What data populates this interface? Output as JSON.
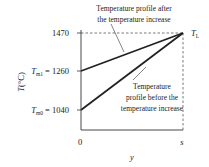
{
  "diagram": {
    "y_axis": {
      "label_main": "T",
      "label_unit": "(°C)",
      "ticks": [
        {
          "value": "1470",
          "prefix": "",
          "sub": ""
        },
        {
          "value": "1260",
          "prefix": "T",
          "sub": "m1",
          "eq": " = 1260"
        },
        {
          "value": "1040",
          "prefix": "T",
          "sub": "m0",
          "eq": " = 1040"
        }
      ]
    },
    "x_axis": {
      "label": "y",
      "ticks": [
        "0",
        "s"
      ]
    },
    "end_label": {
      "main": "T",
      "sub": "L"
    },
    "annotations": {
      "after": {
        "line1": "Temperature profile after",
        "line2": "the temperature increase"
      },
      "before": {
        "line1": "Temperature",
        "line2": "profile before the",
        "line3": "temperature increase"
      }
    },
    "colors": {
      "line": "#222222",
      "dashed": "#555555",
      "axis": "#333333"
    }
  }
}
